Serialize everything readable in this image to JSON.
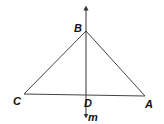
{
  "figure": {
    "points": {
      "B": {
        "label": "B",
        "x": 86,
        "y": 31
      },
      "C": {
        "label": "C",
        "x": 24,
        "y": 94
      },
      "A": {
        "label": "A",
        "x": 145,
        "y": 96
      },
      "D": {
        "label": "D",
        "x": 86,
        "y": 95
      }
    },
    "line": {
      "label": "m",
      "x": 86,
      "y_top": 4,
      "y_bottom": 120
    },
    "colors": {
      "stroke": "#333333",
      "label": "#111111",
      "background": "#ffffff"
    }
  }
}
